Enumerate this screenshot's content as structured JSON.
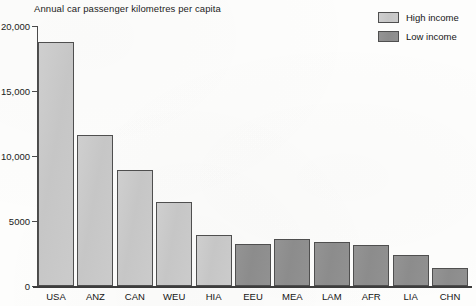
{
  "chart_data": {
    "type": "bar",
    "title": "Annual car passenger kilometres per capita",
    "xlabel": "",
    "ylabel": "",
    "ylim": [
      0,
      20000
    ],
    "grid": false,
    "legend_position": "top-right",
    "y_ticks": [
      {
        "value": 0,
        "label": "0"
      },
      {
        "value": 5000,
        "label": "5000"
      },
      {
        "value": 10000,
        "label": "10,000"
      },
      {
        "value": 15000,
        "label": "15,000"
      },
      {
        "value": 20000,
        "label": "20,000"
      }
    ],
    "categories": [
      "USA",
      "ANZ",
      "CAN",
      "WEU",
      "HIA",
      "EEU",
      "MEA",
      "LAM",
      "AFR",
      "LIA",
      "CHN"
    ],
    "values": [
      18800,
      11600,
      8900,
      6500,
      3900,
      3250,
      3600,
      3350,
      3150,
      2350,
      1350
    ],
    "groups": [
      "High income",
      "High income",
      "High income",
      "High income",
      "High income",
      "Low income",
      "Low income",
      "Low income",
      "Low income",
      "Low income",
      "Low income"
    ],
    "legend": [
      {
        "label": "High income",
        "color": "#c9c9c9"
      },
      {
        "label": "Low income",
        "color": "#8e8e8e"
      }
    ],
    "colors": {
      "high_income": "#c9c9c9",
      "low_income": "#8e8e8e",
      "bar_outline": "#4f4f4f",
      "axis": "#3d3d3d",
      "text": "#161616",
      "background": "#fdfdfc"
    }
  }
}
